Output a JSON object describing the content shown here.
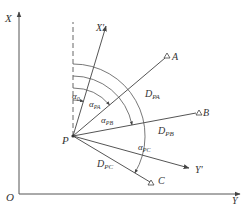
{
  "diagram": {
    "title": "",
    "colors": {
      "line": "#555555",
      "text": "#333333",
      "background": "#ffffff"
    },
    "axes": {
      "origin": {
        "label": "O"
      },
      "x_axis": {
        "label": "X"
      },
      "y_axis": {
        "label": "Y"
      }
    },
    "station": {
      "label": "P"
    },
    "rotated_axes": {
      "x_prime": {
        "label": "X'"
      },
      "y_prime": {
        "label": "Y'"
      }
    },
    "targets": [
      {
        "id": "A",
        "label": "A",
        "distance_label": "D",
        "distance_sub": "PA",
        "angle_label": "α",
        "angle_sub": "PA"
      },
      {
        "id": "B",
        "label": "B",
        "distance_label": "D",
        "distance_sub": "PB",
        "angle_label": "α",
        "angle_sub": "PB"
      },
      {
        "id": "C",
        "label": "C",
        "distance_label": "D",
        "distance_sub": "PC",
        "angle_label": "α",
        "angle_sub": "PC"
      }
    ],
    "rotation_angle": {
      "label": "α",
      "sub": "0"
    }
  }
}
